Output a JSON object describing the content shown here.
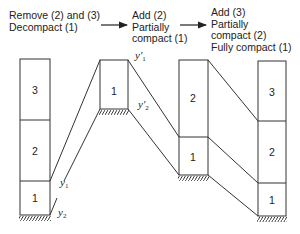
{
  "captions": [
    {
      "lines": [
        "Remove (2) and (3)",
        "Decompact (1)"
      ]
    },
    {
      "lines": [
        "Add (2)",
        "Partially",
        "compact (1)"
      ]
    },
    {
      "lines": [
        "Add (3)",
        "Partially",
        "compact (2)",
        "Fully compact (1)"
      ]
    }
  ],
  "columns": [
    {
      "layers": [
        "3",
        "2",
        "1"
      ]
    },
    {
      "layers": [
        "1"
      ]
    },
    {
      "layers": [
        "2",
        "1"
      ]
    },
    {
      "layers": [
        "3",
        "2",
        "1"
      ]
    }
  ],
  "labels": {
    "y1": "y",
    "y1_sub": "1",
    "y2": "y",
    "y2_sub": "2",
    "y1p": "y'",
    "y1p_sub": "1",
    "y2p": "y'",
    "y2p_sub": "2"
  }
}
